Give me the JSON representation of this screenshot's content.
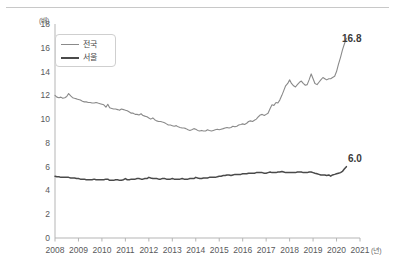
{
  "chart_data": {
    "type": "line",
    "title": "",
    "subtitle": "",
    "xlabel": "연도",
    "ylabel": "",
    "y_unit": "(배)",
    "x_unit": "(년)",
    "xlim": [
      2008,
      2021
    ],
    "ylim": [
      0,
      18
    ],
    "yticks": [
      0,
      2,
      4,
      6,
      8,
      10,
      12,
      14,
      16,
      18
    ],
    "ytick_labels": [
      "0",
      "2",
      "4",
      "6",
      "8",
      "10",
      "12",
      "14",
      "16",
      "18"
    ],
    "xticks": [
      2008,
      2009,
      2010,
      2011,
      2012,
      2013,
      2014,
      2015,
      2016,
      2017,
      2018,
      2019,
      2020,
      2021
    ],
    "xtick_labels": [
      "2008",
      "2009",
      "2010",
      "2011",
      "2012",
      "2013",
      "2014",
      "2015",
      "2016",
      "2017",
      "2018",
      "2019",
      "2020",
      "2021"
    ],
    "grid": false,
    "legend_position": "upper-left",
    "colors": {
      "national": "#8a8a8a",
      "seoul": "#4a4a4a",
      "axis": "#b5b5b5",
      "text": "#58595b",
      "rule": "#c8c8c8"
    },
    "series": [
      {
        "name": "전국",
        "color": "#8a8a8a",
        "width": 1.1,
        "end_label": "16.8",
        "x": [
          2008.0,
          2008.08,
          2008.17,
          2008.25,
          2008.33,
          2008.42,
          2008.5,
          2008.58,
          2008.67,
          2008.75,
          2008.83,
          2008.92,
          2009.0,
          2009.08,
          2009.17,
          2009.25,
          2009.33,
          2009.42,
          2009.5,
          2009.58,
          2009.67,
          2009.75,
          2009.83,
          2009.92,
          2010.0,
          2010.08,
          2010.17,
          2010.25,
          2010.33,
          2010.42,
          2010.5,
          2010.58,
          2010.67,
          2010.75,
          2010.83,
          2010.92,
          2011.0,
          2011.08,
          2011.17,
          2011.25,
          2011.33,
          2011.42,
          2011.5,
          2011.58,
          2011.67,
          2011.75,
          2011.83,
          2011.92,
          2012.0,
          2012.08,
          2012.17,
          2012.25,
          2012.33,
          2012.42,
          2012.5,
          2012.58,
          2012.67,
          2012.75,
          2012.83,
          2012.92,
          2013.0,
          2013.08,
          2013.17,
          2013.25,
          2013.33,
          2013.42,
          2013.5,
          2013.58,
          2013.67,
          2013.75,
          2013.83,
          2013.92,
          2014.0,
          2014.08,
          2014.17,
          2014.25,
          2014.33,
          2014.42,
          2014.5,
          2014.58,
          2014.67,
          2014.75,
          2014.83,
          2014.92,
          2015.0,
          2015.08,
          2015.17,
          2015.25,
          2015.33,
          2015.42,
          2015.5,
          2015.58,
          2015.67,
          2015.75,
          2015.83,
          2015.92,
          2016.0,
          2016.08,
          2016.17,
          2016.25,
          2016.33,
          2016.42,
          2016.5,
          2016.58,
          2016.67,
          2016.75,
          2016.83,
          2016.92,
          2017.0,
          2017.08,
          2017.17,
          2017.25,
          2017.33,
          2017.42,
          2017.5,
          2017.58,
          2017.67,
          2017.75,
          2017.83,
          2017.92,
          2018.0,
          2018.08,
          2018.17,
          2018.25,
          2018.33,
          2018.42,
          2018.5,
          2018.58,
          2018.67,
          2018.75,
          2018.83,
          2018.92,
          2019.0,
          2019.08,
          2019.17,
          2019.25,
          2019.33,
          2019.42,
          2019.5,
          2019.58,
          2019.67,
          2019.75,
          2019.83,
          2019.92,
          2020.0,
          2020.08,
          2020.17,
          2020.25,
          2020.33,
          2020.42
        ],
        "y": [
          12.0,
          11.85,
          11.8,
          11.85,
          11.75,
          11.8,
          11.9,
          12.15,
          11.95,
          11.8,
          11.75,
          11.7,
          11.65,
          11.6,
          11.5,
          11.45,
          11.45,
          11.4,
          11.4,
          11.35,
          11.35,
          11.4,
          11.35,
          11.3,
          11.25,
          11.2,
          11.0,
          11.25,
          10.95,
          10.9,
          10.85,
          10.85,
          10.8,
          10.75,
          10.85,
          10.8,
          10.75,
          10.7,
          10.6,
          10.5,
          10.5,
          10.4,
          10.4,
          10.35,
          10.45,
          10.3,
          10.25,
          10.2,
          10.1,
          10.0,
          10.1,
          9.95,
          9.85,
          9.8,
          9.8,
          9.75,
          9.7,
          9.6,
          9.5,
          9.5,
          9.45,
          9.4,
          9.45,
          9.35,
          9.3,
          9.25,
          9.25,
          9.2,
          9.1,
          9.05,
          9.1,
          9.2,
          9.15,
          9.05,
          9.0,
          9.05,
          9.0,
          9.0,
          9.1,
          9.05,
          9.0,
          9.05,
          9.1,
          9.15,
          9.1,
          9.15,
          9.2,
          9.25,
          9.3,
          9.25,
          9.3,
          9.4,
          9.35,
          9.4,
          9.5,
          9.55,
          9.6,
          9.55,
          9.65,
          9.8,
          9.85,
          9.8,
          9.9,
          10.0,
          10.2,
          10.35,
          10.4,
          10.3,
          10.4,
          10.5,
          10.9,
          11.2,
          11.15,
          11.4,
          11.35,
          11.6,
          12.0,
          12.4,
          12.8,
          13.0,
          13.3,
          13.0,
          12.8,
          12.7,
          12.9,
          13.1,
          13.2,
          13.0,
          12.85,
          12.9,
          13.3,
          13.8,
          13.4,
          13.0,
          12.9,
          13.1,
          13.3,
          13.5,
          13.4,
          13.3,
          13.4,
          13.4,
          13.5,
          13.6,
          14.0,
          14.6,
          15.2,
          15.8,
          16.3,
          16.8
        ]
      },
      {
        "name": "서울",
        "color": "#4a4a4a",
        "width": 1.5,
        "end_label": "6.0",
        "x": [
          2008.0,
          2008.08,
          2008.17,
          2008.25,
          2008.33,
          2008.42,
          2008.5,
          2008.58,
          2008.67,
          2008.75,
          2008.83,
          2008.92,
          2009.0,
          2009.08,
          2009.17,
          2009.25,
          2009.33,
          2009.42,
          2009.5,
          2009.58,
          2009.67,
          2009.75,
          2009.83,
          2009.92,
          2010.0,
          2010.08,
          2010.17,
          2010.25,
          2010.33,
          2010.42,
          2010.5,
          2010.58,
          2010.67,
          2010.75,
          2010.83,
          2010.92,
          2011.0,
          2011.08,
          2011.17,
          2011.25,
          2011.33,
          2011.42,
          2011.5,
          2011.58,
          2011.67,
          2011.75,
          2011.83,
          2011.92,
          2012.0,
          2012.08,
          2012.17,
          2012.25,
          2012.33,
          2012.42,
          2012.5,
          2012.58,
          2012.67,
          2012.75,
          2012.83,
          2012.92,
          2013.0,
          2013.08,
          2013.17,
          2013.25,
          2013.33,
          2013.42,
          2013.5,
          2013.58,
          2013.67,
          2013.75,
          2013.83,
          2013.92,
          2014.0,
          2014.08,
          2014.17,
          2014.25,
          2014.33,
          2014.42,
          2014.5,
          2014.58,
          2014.67,
          2014.75,
          2014.83,
          2014.92,
          2015.0,
          2015.08,
          2015.17,
          2015.25,
          2015.33,
          2015.42,
          2015.5,
          2015.58,
          2015.67,
          2015.75,
          2015.83,
          2015.92,
          2016.0,
          2016.08,
          2016.17,
          2016.25,
          2016.33,
          2016.42,
          2016.5,
          2016.58,
          2016.67,
          2016.75,
          2016.83,
          2016.92,
          2017.0,
          2017.08,
          2017.17,
          2017.25,
          2017.33,
          2017.42,
          2017.5,
          2017.58,
          2017.67,
          2017.75,
          2017.83,
          2017.92,
          2018.0,
          2018.08,
          2018.17,
          2018.25,
          2018.33,
          2018.42,
          2018.5,
          2018.58,
          2018.67,
          2018.75,
          2018.83,
          2018.92,
          2019.0,
          2019.08,
          2019.17,
          2019.25,
          2019.33,
          2019.42,
          2019.5,
          2019.58,
          2019.67,
          2019.75,
          2019.83,
          2019.92,
          2020.0,
          2020.08,
          2020.17,
          2020.25,
          2020.33,
          2020.42
        ],
        "y": [
          5.2,
          5.15,
          5.15,
          5.1,
          5.1,
          5.1,
          5.1,
          5.1,
          5.05,
          5.05,
          5.05,
          5.0,
          5.0,
          4.95,
          4.95,
          4.95,
          4.9,
          4.9,
          4.9,
          4.9,
          4.95,
          4.9,
          4.9,
          4.9,
          4.9,
          4.9,
          4.95,
          4.95,
          4.85,
          4.85,
          4.85,
          4.9,
          4.9,
          4.85,
          4.85,
          4.9,
          5.0,
          4.9,
          4.9,
          4.95,
          4.95,
          4.95,
          5.0,
          5.0,
          4.95,
          4.95,
          5.0,
          5.0,
          5.1,
          5.05,
          5.0,
          5.0,
          5.0,
          4.95,
          4.95,
          5.0,
          5.0,
          4.95,
          4.95,
          4.95,
          5.0,
          4.95,
          4.95,
          4.95,
          4.95,
          5.0,
          4.95,
          4.95,
          4.95,
          5.0,
          5.0,
          5.0,
          5.1,
          5.05,
          5.0,
          5.0,
          5.05,
          5.05,
          5.05,
          5.1,
          5.1,
          5.1,
          5.1,
          5.15,
          5.2,
          5.2,
          5.25,
          5.25,
          5.3,
          5.3,
          5.25,
          5.3,
          5.35,
          5.35,
          5.35,
          5.35,
          5.4,
          5.4,
          5.4,
          5.45,
          5.45,
          5.45,
          5.45,
          5.5,
          5.5,
          5.5,
          5.5,
          5.45,
          5.45,
          5.5,
          5.55,
          5.5,
          5.5,
          5.5,
          5.55,
          5.55,
          5.6,
          5.55,
          5.5,
          5.5,
          5.5,
          5.5,
          5.5,
          5.5,
          5.55,
          5.55,
          5.55,
          5.5,
          5.5,
          5.5,
          5.55,
          5.55,
          5.5,
          5.45,
          5.4,
          5.35,
          5.3,
          5.3,
          5.3,
          5.25,
          5.3,
          5.2,
          5.3,
          5.35,
          5.4,
          5.45,
          5.5,
          5.6,
          5.8,
          6.0
        ]
      }
    ]
  }
}
